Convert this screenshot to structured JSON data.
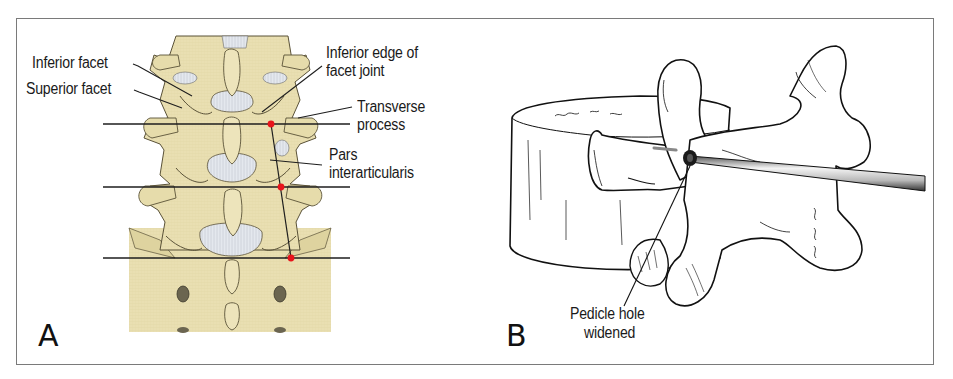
{
  "figure": {
    "border_color": "#7a7a7a",
    "panels": [
      {
        "id": "A",
        "letter": "A",
        "description": "Posterior view of lumbar spine with horizontal reference lines and red landmark points",
        "colors": {
          "bone": "#e9dfb2",
          "bone_shadow": "#cfc48f",
          "disc": "#dfe4ea",
          "outline": "#4a4433",
          "marker": "#e8141b",
          "line": "#1e1e1e"
        },
        "labels": [
          {
            "key": "inferior_facet",
            "text": "Inferior facet"
          },
          {
            "key": "superior_facet",
            "text": "Superior facet"
          },
          {
            "key": "inferior_edge_line1",
            "text": "Inferior edge of"
          },
          {
            "key": "inferior_edge_line2",
            "text": "facet joint"
          },
          {
            "key": "transverse_line1",
            "text": "Transverse"
          },
          {
            "key": "transverse_line2",
            "text": "process"
          },
          {
            "key": "pars_line1",
            "text": "Pars"
          },
          {
            "key": "pars_line2",
            "text": "interarticularis"
          }
        ]
      },
      {
        "id": "B",
        "letter": "B",
        "description": "Line drawing of a vertebra with a probe inserted into the pedicle",
        "colors": {
          "outline": "#111111",
          "probe": "#bdbdbd"
        },
        "labels": [
          {
            "key": "pedicle_line1",
            "text": "Pedicle hole"
          },
          {
            "key": "pedicle_line2",
            "text": "widened"
          }
        ]
      }
    ]
  },
  "A": {
    "letter": "A",
    "inferior_facet": "Inferior facet",
    "superior_facet": "Superior facet",
    "inferior_edge_1": "Inferior edge of",
    "inferior_edge_2": "facet joint",
    "transverse_1": "Transverse",
    "transverse_2": "process",
    "pars_1": "Pars",
    "pars_2": "interarticularis"
  },
  "B": {
    "letter": "B",
    "pedicle_1": "Pedicle hole",
    "pedicle_2": "widened"
  }
}
